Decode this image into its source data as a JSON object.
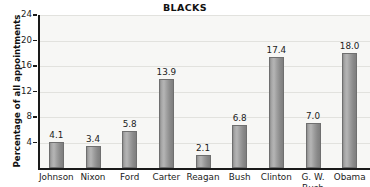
{
  "chart_data": {
    "type": "bar",
    "title": "BLACKS",
    "xlabel": "",
    "ylabel": "Percentage of all appointments",
    "categories": [
      "Johnson",
      "Nixon",
      "Ford",
      "Carter",
      "Reagan",
      "Bush",
      "Clinton",
      "G. W.\nBush",
      "Obama"
    ],
    "values": [
      4.1,
      3.4,
      5.8,
      13.9,
      2.1,
      6.8,
      17.4,
      7.0,
      18.0
    ],
    "value_labels": [
      "4.1",
      "3.4",
      "5.8",
      "13.9",
      "2.1",
      "6.8",
      "17.4",
      "7.0",
      "18.0"
    ],
    "ylim": [
      0,
      24
    ],
    "yticks": [
      4,
      8,
      12,
      16,
      20,
      24
    ],
    "ytick_labels": [
      "4",
      "8",
      "12",
      "16",
      "20",
      "24"
    ],
    "grid": true,
    "legend": false,
    "legend_position": "none",
    "colors": {
      "bar_fill": "#a0a0a0",
      "bar_edge": "#6f6f6f",
      "plot_background": "#f7f7f5",
      "axis": "#1a1a1a",
      "gridline": "#e2e2de",
      "text": "#1c1c1c"
    }
  }
}
